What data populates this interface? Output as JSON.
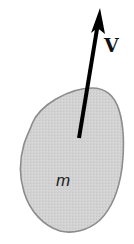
{
  "diagram": {
    "type": "physics-free-body",
    "body": {
      "label": "m",
      "shape": "irregular-blob",
      "fill_color": "#d2d2d2",
      "outline_color": "#8c8c8c"
    },
    "vector": {
      "label": "V",
      "color": "#000000",
      "direction": "up-right"
    }
  }
}
